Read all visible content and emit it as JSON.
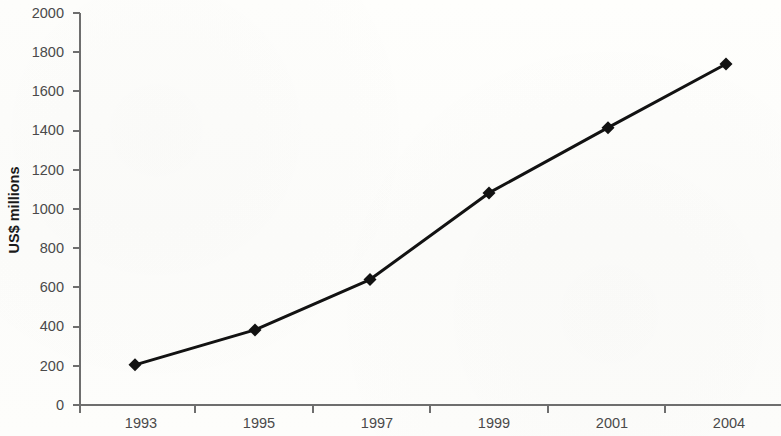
{
  "chart_data": {
    "type": "line",
    "title": "",
    "subtitle": "",
    "xlabel": "",
    "ylabel": "US$ millions",
    "categories": [
      "1993",
      "1995",
      "1997",
      "1999",
      "2001",
      "2004"
    ],
    "x": [
      1993,
      1995,
      1997,
      1999,
      2001,
      2004
    ],
    "values": [
      205,
      383,
      640,
      1082,
      1415,
      1740
    ],
    "series": [
      {
        "name": "US$ millions",
        "values": [
          205,
          383,
          640,
          1082,
          1415,
          1740
        ]
      }
    ],
    "ylim": [
      0,
      2000
    ],
    "yticks": [
      0,
      200,
      400,
      600,
      800,
      1000,
      1200,
      1400,
      1600,
      1800,
      2000
    ],
    "ytick_labels": [
      "0",
      "200",
      "400",
      "600",
      "800",
      "1000",
      "1200",
      "1400",
      "1600",
      "1800",
      "2000"
    ],
    "xtick_labels": [
      "1993",
      "1995",
      "1997",
      "1999",
      "2001",
      "2004"
    ],
    "grid": false,
    "legend": false,
    "legend_position": "none",
    "marker": "diamond",
    "line_color": "#121212",
    "marker_color": "#121212",
    "axis_color": "#6e6e6e",
    "tick_label_color": "#4a4a4a",
    "axis_title_color": "#1a1a1a",
    "background_color": "#fdfdfb",
    "annotations": []
  },
  "layout": {
    "plot_left": 80,
    "plot_right": 781,
    "plot_top": 13,
    "plot_bottom": 405,
    "point_x_positions": [
      135,
      255,
      370,
      489,
      608,
      726
    ],
    "xtick_x_positions": [
      80,
      195,
      313,
      430,
      548,
      665
    ],
    "xlabel_x_positions": [
      141,
      259,
      377,
      494,
      612,
      729
    ]
  }
}
